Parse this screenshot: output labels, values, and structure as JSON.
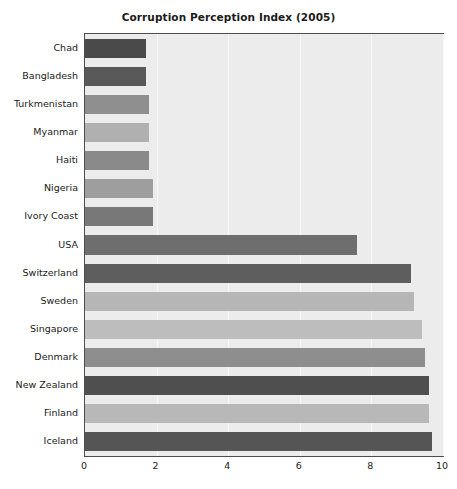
{
  "chart_data": {
    "type": "bar",
    "orientation": "horizontal",
    "title": "Corruption Perception Index (2005)",
    "xlabel": "",
    "ylabel": "",
    "categories": [
      "Chad",
      "Bangladesh",
      "Turkmenistan",
      "Myanmar",
      "Haiti",
      "Nigeria",
      "Ivory Coast",
      "USA",
      "Switzerland",
      "Sweden",
      "Singapore",
      "Denmark",
      "New Zealand",
      "Finland",
      "Iceland"
    ],
    "values": [
      1.7,
      1.7,
      1.8,
      1.8,
      1.8,
      1.9,
      1.9,
      7.6,
      9.1,
      9.2,
      9.4,
      9.5,
      9.6,
      9.6,
      9.7
    ],
    "bar_colors": [
      "#4a4a4a",
      "#595959",
      "#8f8f8f",
      "#b0b0b0",
      "#8a8a8a",
      "#9e9e9e",
      "#787878",
      "#6e6e6e",
      "#5e5e5e",
      "#b6b6b6",
      "#bdbdbd",
      "#8e8e8e",
      "#4f4f4f",
      "#b8b8b8",
      "#555555"
    ],
    "xlim": [
      0,
      10
    ],
    "xticks": [
      0,
      2,
      4,
      6,
      8,
      10
    ],
    "xtick_labels": [
      "0",
      "2",
      "4",
      "6",
      "8",
      "10"
    ],
    "grid": true,
    "grid_axis": "x",
    "grid_color": "#f7f7f7",
    "legend": null,
    "plot_background": "#ececec",
    "figure_background": "#ffffff",
    "axis_color": "#4d4d4d"
  }
}
